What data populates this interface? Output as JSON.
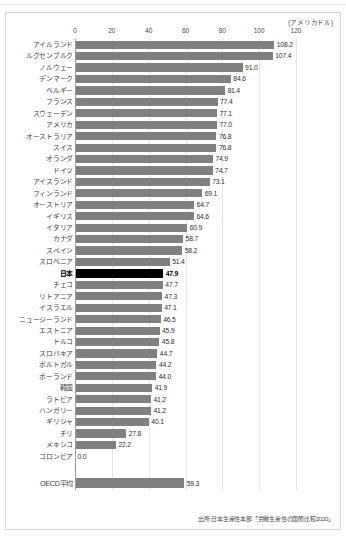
{
  "unit_caption": "(アメリカドル)",
  "source_note": "出所:日本生産性本部「労働生産性の国際比較2020」",
  "colors": {
    "bar": "#808080",
    "highlight_bar": "#000000",
    "gridline": "#e6e6e6",
    "axis": "#9a9a9a",
    "frame": "#d8d8d8"
  },
  "chart_data": {
    "type": "bar",
    "orientation": "horizontal",
    "title": "",
    "subtitle": "",
    "xlabel": "(アメリカドル)",
    "ylabel": "",
    "xlim": [
      0,
      120
    ],
    "ticks": [
      0,
      20,
      40,
      60,
      80,
      100,
      120
    ],
    "tick_labels": [
      "0",
      "20",
      "40",
      "60",
      "80",
      "100",
      "120"
    ],
    "grid": true,
    "legend": "none",
    "highlight_category": "日本",
    "value_format": "1 decimal",
    "categories": [
      "アイルランド",
      "ルクセンブルク",
      "ノルウェー",
      "デンマーク",
      "ベルギー",
      "フランス",
      "スウェーデン",
      "アメリカ",
      "オーストラリア",
      "スイス",
      "オランダ",
      "ドイツ",
      "アイスランド",
      "フィンランド",
      "オーストリア",
      "イギリス",
      "イタリア",
      "カナダ",
      "スペイン",
      "スロベニア",
      "日本",
      "チェコ",
      "リトアニア",
      "イスラエル",
      "ニュージーランド",
      "エストニア",
      "トルコ",
      "スロバキア",
      "ポルトガル",
      "ポーランド",
      "韓国",
      "ラトビア",
      "ハンガリー",
      "ギリシャ",
      "チリ",
      "メキシコ",
      "コロンビア"
    ],
    "values": [
      108.2,
      107.4,
      91.0,
      84.6,
      81.4,
      77.4,
      77.1,
      77.0,
      76.8,
      76.8,
      74.9,
      74.7,
      73.1,
      69.1,
      64.7,
      64.6,
      60.9,
      58.7,
      58.2,
      51.4,
      47.9,
      47.7,
      47.3,
      47.1,
      46.5,
      45.9,
      45.8,
      44.7,
      44.2,
      44.0,
      41.9,
      41.2,
      41.2,
      40.1,
      27.8,
      22.2,
      0.0
    ],
    "value_labels": [
      "108.2",
      "107.4",
      "91.0",
      "84.6",
      "81.4",
      "77.4",
      "77.1",
      "77.0",
      "76.8",
      "76.8",
      "74.9",
      "74.7",
      "73.1",
      "69.1",
      "64.7",
      "64.6",
      "60.9",
      "58.7",
      "58.2",
      "51.4",
      "47.9",
      "47.7",
      "47.3",
      "47.1",
      "46.5",
      "45.9",
      "45.8",
      "44.7",
      "44.2",
      "44.0",
      "41.9",
      "41.2",
      "41.2",
      "40.1",
      "27.8",
      "22.2",
      "0.0"
    ],
    "average": {
      "label": "OECD平均",
      "value": 59.3,
      "value_label": "59.3"
    }
  }
}
